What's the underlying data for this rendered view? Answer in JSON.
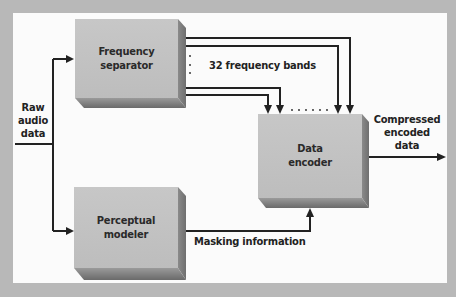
{
  "diagram": {
    "type": "block-diagram",
    "nodes": {
      "freq_sep": {
        "line1": "Frequency",
        "line2": "separator"
      },
      "encoder": {
        "line1": "Data",
        "line2": "encoder"
      },
      "percept": {
        "line1": "Perceptual",
        "line2": "modeler"
      }
    },
    "labels": {
      "input": {
        "line1": "Raw",
        "line2": "audio",
        "line3": "data"
      },
      "bands": "32 frequency bands",
      "masking": "Masking information",
      "output": {
        "line1": "Compressed",
        "line2": "encoded",
        "line3": "data"
      }
    },
    "edges": [
      {
        "from": "Raw audio data",
        "to": "Frequency separator"
      },
      {
        "from": "Raw audio data",
        "to": "Perceptual modeler"
      },
      {
        "from": "Frequency separator",
        "to": "Data encoder",
        "label": "32 frequency bands"
      },
      {
        "from": "Perceptual modeler",
        "to": "Data encoder",
        "label": "Masking information"
      },
      {
        "from": "Data encoder",
        "to": "Compressed encoded data"
      }
    ],
    "colors": {
      "frame": "#b8b8b8",
      "panel": "#fbfbfb",
      "box": "#c3c3c3",
      "line": "#222222"
    }
  }
}
